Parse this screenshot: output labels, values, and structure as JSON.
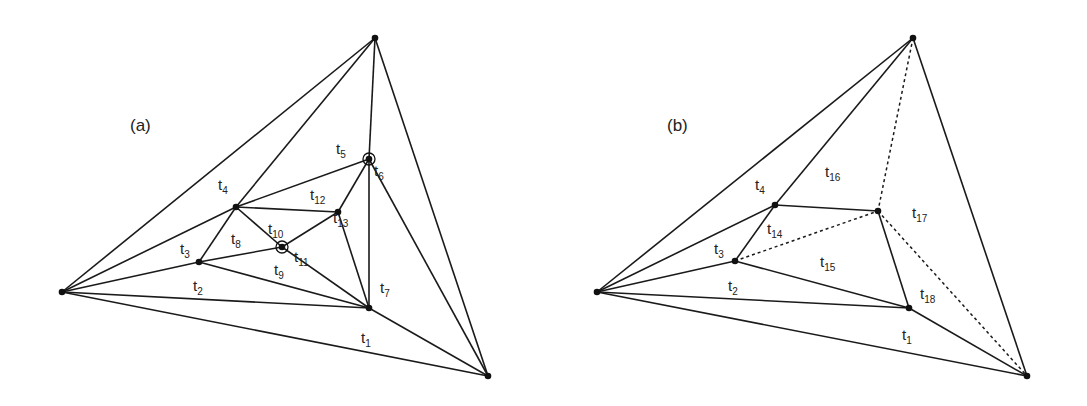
{
  "figure": {
    "panels": [
      {
        "id": "a",
        "label": "(a)",
        "label_pos": [
          130,
          131
        ],
        "vertices": {
          "L": [
            62,
            292
          ],
          "T": [
            375,
            38
          ],
          "BR": [
            488,
            376
          ],
          "P4": [
            236,
            207
          ],
          "P2": [
            199,
            262
          ],
          "P9": [
            282,
            247
          ],
          "P13": [
            338,
            212
          ],
          "P5": [
            369,
            159
          ],
          "P1": [
            369,
            308
          ]
        },
        "ringed_vertices": [
          "P9",
          "P5"
        ],
        "edges": [
          [
            "L",
            "T"
          ],
          [
            "L",
            "BR"
          ],
          [
            "T",
            "BR"
          ],
          [
            "L",
            "P4"
          ],
          [
            "L",
            "P2"
          ],
          [
            "L",
            "P1"
          ],
          [
            "T",
            "P4"
          ],
          [
            "T",
            "P5"
          ],
          [
            "BR",
            "P1"
          ],
          [
            "BR",
            "P5"
          ],
          [
            "P4",
            "P2"
          ],
          [
            "P4",
            "P5"
          ],
          [
            "P4",
            "P13"
          ],
          [
            "P4",
            "P9"
          ],
          [
            "P2",
            "P9"
          ],
          [
            "P2",
            "P1"
          ],
          [
            "P9",
            "P13"
          ],
          [
            "P9",
            "P1"
          ],
          [
            "P13",
            "P5"
          ],
          [
            "P13",
            "P1"
          ],
          [
            "P5",
            "P1"
          ]
        ],
        "dashed_edges": [],
        "triangle_labels": [
          {
            "t": "t",
            "sub": "1",
            "pos": [
              361,
              343
            ]
          },
          {
            "t": "t",
            "sub": "2",
            "pos": [
              193,
              291
            ]
          },
          {
            "t": "t",
            "sub": "3",
            "pos": [
              180,
              254
            ]
          },
          {
            "t": "t",
            "sub": "4",
            "pos": [
              218,
              190
            ]
          },
          {
            "t": "t",
            "sub": "5",
            "pos": [
              336,
              154
            ]
          },
          {
            "t": "t",
            "sub": "6",
            "pos": [
              374,
              176
            ]
          },
          {
            "t": "t",
            "sub": "7",
            "pos": [
              380,
              293
            ]
          },
          {
            "t": "t",
            "sub": "8",
            "pos": [
              231,
              244
            ]
          },
          {
            "t": "t",
            "sub": "9",
            "pos": [
              274,
              275
            ]
          },
          {
            "t": "t",
            "sub": "10",
            "pos": [
              268,
              234
            ]
          },
          {
            "t": "t",
            "sub": "11",
            "pos": [
              294,
              262
            ]
          },
          {
            "t": "t",
            "sub": "12",
            "pos": [
              310,
              200
            ]
          },
          {
            "t": "t",
            "sub": "13",
            "pos": [
              333,
              223
            ]
          }
        ]
      },
      {
        "id": "b",
        "label": "(b)",
        "label_pos": [
          667,
          131
        ],
        "vertices": {
          "L": [
            597,
            292
          ],
          "T": [
            913,
            38
          ],
          "BR": [
            1027,
            376
          ],
          "P4": [
            775,
            205
          ],
          "P2": [
            735,
            261
          ],
          "PN": [
            878,
            211
          ],
          "P1": [
            909,
            308
          ]
        },
        "ringed_vertices": [],
        "edges": [
          [
            "L",
            "T"
          ],
          [
            "L",
            "BR"
          ],
          [
            "T",
            "BR"
          ],
          [
            "L",
            "P4"
          ],
          [
            "L",
            "P2"
          ],
          [
            "L",
            "P1"
          ],
          [
            "T",
            "P4"
          ],
          [
            "BR",
            "P1"
          ],
          [
            "P4",
            "P2"
          ],
          [
            "P4",
            "PN"
          ],
          [
            "P2",
            "P1"
          ],
          [
            "PN",
            "P1"
          ]
        ],
        "dashed_edges": [
          [
            "T",
            "PN"
          ],
          [
            "P2",
            "PN"
          ],
          [
            "PN",
            "BR"
          ]
        ],
        "triangle_labels": [
          {
            "t": "t",
            "sub": "1",
            "pos": [
              902,
              340
            ]
          },
          {
            "t": "t",
            "sub": "2",
            "pos": [
              728,
              291
            ]
          },
          {
            "t": "t",
            "sub": "3",
            "pos": [
              714,
              254
            ]
          },
          {
            "t": "t",
            "sub": "4",
            "pos": [
              755,
              190
            ]
          },
          {
            "t": "t",
            "sub": "14",
            "pos": [
              767,
              234
            ]
          },
          {
            "t": "t",
            "sub": "15",
            "pos": [
              820,
              267
            ]
          },
          {
            "t": "t",
            "sub": "16",
            "pos": [
              825,
              177
            ]
          },
          {
            "t": "t",
            "sub": "17",
            "pos": [
              912,
              218
            ]
          },
          {
            "t": "t",
            "sub": "18",
            "pos": [
              920,
              299
            ]
          }
        ]
      }
    ]
  }
}
